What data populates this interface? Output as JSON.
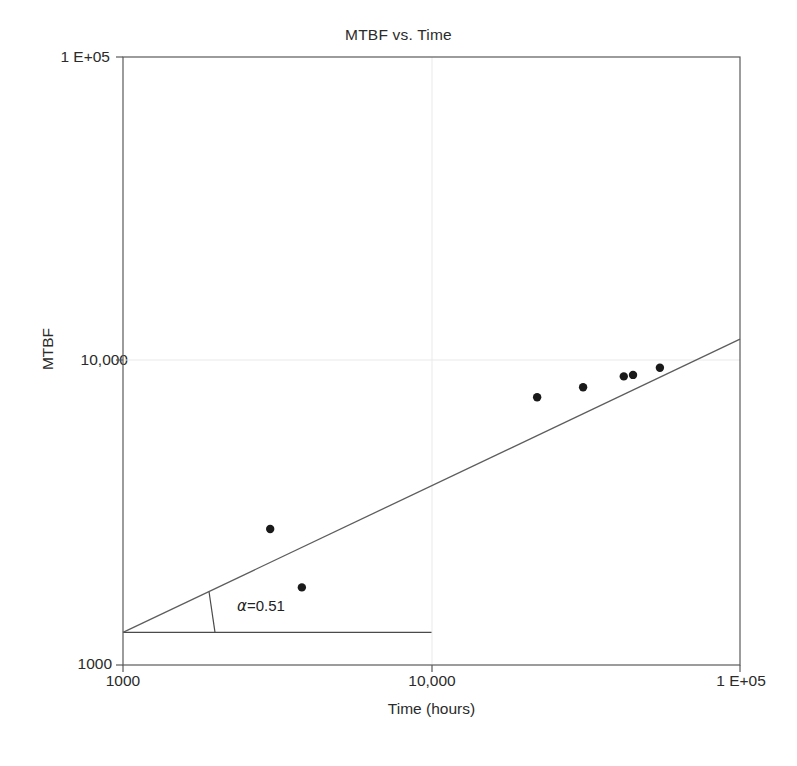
{
  "chart_data": {
    "type": "scatter",
    "title": "MTBF vs. Time",
    "xlabel": "Time (hours)",
    "ylabel": "MTBF",
    "xscale": "log",
    "yscale": "log",
    "xlim": [
      1000,
      100000
    ],
    "ylim": [
      1000,
      100000
    ],
    "grid": true,
    "legend": null,
    "xticks": [
      "1000",
      "10,000",
      "1 E+05"
    ],
    "xtick_values": [
      1000,
      10000,
      100000
    ],
    "yticks": [
      "1000",
      "10,000",
      "1 E+05"
    ],
    "ytick_values": [
      1000,
      10000,
      100000
    ],
    "points": [
      {
        "x": 3000,
        "y": 2800
      },
      {
        "x": 3800,
        "y": 1800
      },
      {
        "x": 22000,
        "y": 7600
      },
      {
        "x": 31000,
        "y": 8200
      },
      {
        "x": 42000,
        "y": 8900
      },
      {
        "x": 45000,
        "y": 9000
      },
      {
        "x": 55000,
        "y": 9500
      }
    ],
    "fit_line": {
      "name": "trend-line",
      "x_start": 1000,
      "y_start": 1280,
      "x_end": 100000,
      "y_end": 11800,
      "slope_alpha": 0.51
    },
    "slope_triangle": {
      "baseline_y": 1280,
      "baseline_x_start": 1000,
      "baseline_x_end": 10000,
      "tick_x": 1900
    },
    "annotations": [
      {
        "name": "alpha-annotation",
        "symbol": "α",
        "text": "=0.51",
        "full": "α=0.51"
      }
    ],
    "colors": {
      "marker": "#1a1a1a",
      "line": "#555555",
      "axis": "#4a4a4a",
      "grid": "#e8e8e8",
      "background": "#ffffff",
      "text": "#2b2b2b"
    }
  }
}
